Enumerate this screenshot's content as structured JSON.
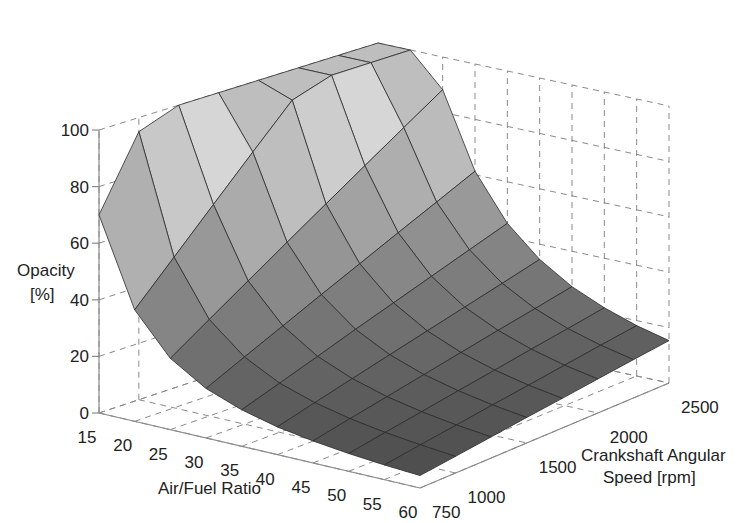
{
  "chart_data": {
    "type": "surface3d",
    "title": "",
    "xlabel": "Air/Fuel Ratio",
    "ylabel": "Crankshaft Angular Speed [rpm]",
    "ylabel_lines": [
      "Crankshaft Angular",
      "Speed [rpm]"
    ],
    "zlabel": "Opacity [%]",
    "zlabel_lines": [
      "Opacity",
      "[%]"
    ],
    "x_ticks": [
      15,
      20,
      25,
      30,
      35,
      40,
      45,
      50,
      55,
      60
    ],
    "y_ticks": [
      750,
      1000,
      1500,
      2000,
      2500
    ],
    "z_ticks": [
      0,
      20,
      40,
      60,
      80,
      100
    ],
    "xlim": [
      15,
      60
    ],
    "ylim": [
      750,
      2500
    ],
    "zlim": [
      0,
      100
    ],
    "grid": true,
    "colormap": "gray",
    "x": [
      15,
      20,
      25,
      30,
      35,
      40,
      45,
      50,
      55,
      60
    ],
    "y": [
      750,
      1000,
      1250,
      1500,
      1750,
      2000,
      2250,
      2500
    ],
    "z": [
      [
        70,
        39.4,
        25.2,
        17.5,
        12.9,
        9.8,
        7.8,
        6.3,
        5.2,
        4.4
      ],
      [
        95,
        53.4,
        34.2,
        23.8,
        17.4,
        13.4,
        10.6,
        8.6,
        7.1,
        5.9
      ],
      [
        100,
        67.5,
        43.2,
        30.0,
        22.0,
        16.9,
        13.3,
        10.8,
        8.9,
        7.5
      ],
      [
        100,
        81.6,
        52.2,
        36.3,
        26.7,
        20.4,
        16.1,
        13.1,
        10.8,
        9.1
      ],
      [
        100,
        95.6,
        61.2,
        42.5,
        31.2,
        23.9,
        18.9,
        15.3,
        12.6,
        10.6
      ],
      [
        100,
        100,
        70.2,
        48.8,
        35.8,
        27.4,
        21.7,
        17.6,
        14.5,
        12.2
      ],
      [
        100,
        100,
        79.2,
        55.0,
        40.4,
        30.9,
        24.4,
        19.8,
        16.4,
        13.8
      ],
      [
        100,
        100,
        88.2,
        61.3,
        45.0,
        34.5,
        27.2,
        22.1,
        18.2,
        15.3
      ]
    ]
  }
}
